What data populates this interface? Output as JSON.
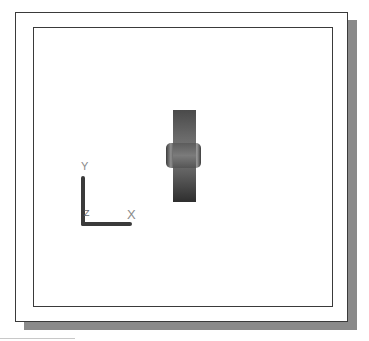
{
  "viewport": {
    "colors": {
      "background": "#ffffff",
      "frame_border": "#3a3a3a",
      "shadow": "#8a8a8a",
      "part_dark": "#2e2e2e",
      "part_mid": "#6a6a6a",
      "ucs_bar": "#3a3a3a",
      "ucs_label": "#8a8a8a"
    }
  },
  "ucs_icon": {
    "y_label": "Y",
    "x_label": "X",
    "z_label": "Z"
  }
}
